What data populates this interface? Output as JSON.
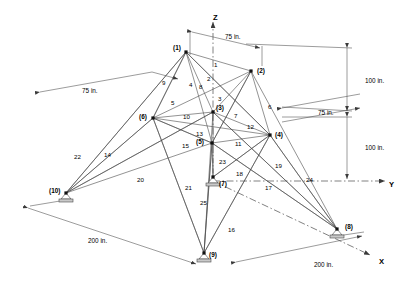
{
  "figure": {
    "type": "engineering-diagram",
    "background_color": "#ffffff",
    "line_color": "#3a3a3a",
    "text_color": "#000000"
  },
  "axes": [
    {
      "name": "z-axis",
      "label": "Z",
      "x": 213,
      "y": 14,
      "dir": "up"
    },
    {
      "name": "y-axis",
      "label": "Y",
      "x": 389,
      "y": 181,
      "dir": "right"
    },
    {
      "name": "x-axis",
      "label": "X",
      "x": 379,
      "y": 258,
      "dir": "down-right"
    }
  ],
  "nodes": [
    {
      "id": "1",
      "label": "(1)",
      "x": 186,
      "y": 52,
      "lx": 173,
      "ly": 45,
      "support": false
    },
    {
      "id": "2",
      "label": "(2)",
      "x": 251,
      "y": 71,
      "lx": 257,
      "ly": 68,
      "support": false
    },
    {
      "id": "3",
      "label": "(3)",
      "x": 213,
      "y": 112,
      "lx": 216,
      "ly": 105,
      "support": false
    },
    {
      "id": "4",
      "label": "(4)",
      "x": 270,
      "y": 135,
      "lx": 275,
      "ly": 132,
      "support": false
    },
    {
      "id": "5",
      "label": "(5)",
      "x": 212,
      "y": 143,
      "lx": 196,
      "ly": 139,
      "support": false
    },
    {
      "id": "6",
      "label": "(6)",
      "x": 153,
      "y": 118,
      "lx": 139,
      "ly": 114,
      "support": false
    },
    {
      "id": "7",
      "label": "(7)",
      "x": 213,
      "y": 177,
      "lx": 219,
      "ly": 181,
      "support": true
    },
    {
      "id": "8",
      "label": "(8)",
      "x": 337,
      "y": 229,
      "lx": 345,
      "ly": 224,
      "support": true
    },
    {
      "id": "9",
      "label": "(9)",
      "x": 204,
      "y": 253,
      "lx": 209,
      "ly": 252,
      "support": true
    },
    {
      "id": "10",
      "label": "(10)",
      "x": 66,
      "y": 193,
      "lx": 49,
      "ly": 188,
      "support": true
    }
  ],
  "members": [
    {
      "id": "1",
      "label": "1",
      "from": "1",
      "to": "2",
      "lx": 214,
      "ly": 62
    },
    {
      "id": "2",
      "label": "2",
      "from": "1",
      "to": "3",
      "lx": 207,
      "ly": 76
    },
    {
      "id": "3",
      "label": "3",
      "from": "2",
      "to": "3",
      "lx": 218,
      "ly": 96
    },
    {
      "id": "4",
      "label": "4",
      "from": "1",
      "to": "5",
      "lx": 189,
      "ly": 82
    },
    {
      "id": "5",
      "label": "5",
      "from": "1",
      "to": "6",
      "lx": 171,
      "ly": 100
    },
    {
      "id": "6",
      "label": "6",
      "from": "2",
      "to": "4",
      "lx": 268,
      "ly": 104
    },
    {
      "id": "7",
      "label": "7",
      "from": "2",
      "to": "5",
      "lx": 234,
      "ly": 113
    },
    {
      "id": "8",
      "label": "8",
      "from": "1",
      "to": "4",
      "lx": 199,
      "ly": 84
    },
    {
      "id": "9",
      "label": "9",
      "from": "1",
      "to": "6",
      "lx": 162,
      "ly": 80
    },
    {
      "id": "10",
      "label": "10",
      "from": "6",
      "to": "3",
      "lx": 183,
      "ly": 114
    },
    {
      "id": "11",
      "label": "11",
      "from": "5",
      "to": "4",
      "lx": 235,
      "ly": 141
    },
    {
      "id": "12",
      "label": "12",
      "from": "3",
      "to": "4",
      "lx": 247,
      "ly": 124
    },
    {
      "id": "13",
      "label": "13",
      "from": "6",
      "to": "5",
      "lx": 196,
      "ly": 131
    },
    {
      "id": "14",
      "label": "14",
      "from": "6",
      "to": "10",
      "lx": 104,
      "ly": 152
    },
    {
      "id": "15",
      "label": "15",
      "from": "6",
      "to": "5",
      "lx": 182,
      "ly": 143
    },
    {
      "id": "16",
      "label": "16",
      "from": "9",
      "to": "4",
      "lx": 228,
      "ly": 227
    },
    {
      "id": "17",
      "label": "17",
      "from": "8",
      "to": "5",
      "lx": 265,
      "ly": 185
    },
    {
      "id": "18",
      "label": "18",
      "from": "7",
      "to": "4",
      "lx": 236,
      "ly": 171
    },
    {
      "id": "19",
      "label": "19",
      "from": "8",
      "to": "4",
      "lx": 275,
      "ly": 163
    },
    {
      "id": "20",
      "label": "20",
      "from": "10",
      "to": "3",
      "lx": 137,
      "ly": 177
    },
    {
      "id": "21",
      "label": "21",
      "from": "9",
      "to": "6",
      "lx": 185,
      "ly": 185
    },
    {
      "id": "22",
      "label": "22",
      "from": "10",
      "to": "1",
      "lx": 74,
      "ly": 154
    },
    {
      "id": "23",
      "label": "23",
      "from": "5",
      "to": "7",
      "lx": 219,
      "ly": 159
    },
    {
      "id": "24",
      "label": "24",
      "from": "8",
      "to": "3",
      "lx": 306,
      "ly": 177
    },
    {
      "id": "25",
      "label": "25",
      "from": "9",
      "to": "5",
      "lx": 200,
      "ly": 200
    }
  ],
  "dimensions": [
    {
      "id": "top-75",
      "label": "75 in.",
      "lx": 225,
      "ly": 34,
      "orientation": "horizontal"
    },
    {
      "id": "left-75",
      "label": "75 in.",
      "lx": 82,
      "ly": 88,
      "orientation": "horizontal"
    },
    {
      "id": "right-75",
      "label": "75 in.",
      "lx": 318,
      "ly": 110,
      "orientation": "horizontal"
    },
    {
      "id": "upper-100",
      "label": "100 in.",
      "lx": 365,
      "ly": 78,
      "orientation": "vertical"
    },
    {
      "id": "lower-100",
      "label": "100 in.",
      "lx": 365,
      "ly": 145,
      "orientation": "vertical"
    },
    {
      "id": "left-200",
      "label": "200 in.",
      "lx": 88,
      "ly": 238,
      "orientation": "oblique"
    },
    {
      "id": "right-200",
      "label": "200 in.",
      "lx": 314,
      "ly": 262,
      "orientation": "oblique"
    }
  ],
  "chart_data": {
    "type": "diagram",
    "node_count": 10,
    "member_count": 25,
    "support_nodes": [
      "7",
      "8",
      "9",
      "10"
    ],
    "dimension_values": [
      "75 in.",
      "75 in.",
      "75 in.",
      "100 in.",
      "100 in.",
      "200 in.",
      "200 in."
    ],
    "axis_labels": [
      "Z",
      "Y",
      "X"
    ]
  }
}
